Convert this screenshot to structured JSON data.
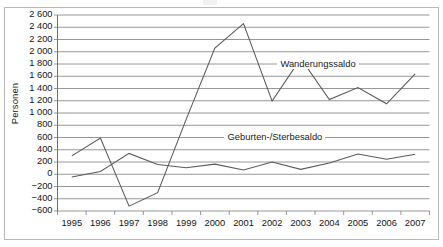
{
  "figure": {
    "y_axis_title": "Personen"
  },
  "chart_data": {
    "type": "line",
    "title": "",
    "xlabel": "",
    "ylabel": "Personen",
    "x": [
      1995,
      1996,
      1997,
      1998,
      1999,
      2000,
      2001,
      2002,
      2003,
      2004,
      2005,
      2006,
      2007
    ],
    "categories": [
      "1995",
      "1996",
      "1997",
      "1998",
      "1999",
      "2000",
      "2001",
      "2002",
      "2003",
      "2004",
      "2005",
      "2006",
      "2007"
    ],
    "ylim": [
      -600,
      2600
    ],
    "ytick_labels": [
      "2 600",
      "2 400",
      "2 200",
      "2 000",
      "1 800",
      "1 600",
      "1 400",
      "1 200",
      "1 000",
      "800",
      "600",
      "400",
      "200",
      "0",
      "−200",
      "−400",
      "−600"
    ],
    "ytick_values": [
      2600,
      2400,
      2200,
      2000,
      1800,
      1600,
      1400,
      1200,
      1000,
      800,
      600,
      400,
      200,
      0,
      -200,
      -400,
      -600
    ],
    "grid": true,
    "legend_position": "inline-annotations",
    "series": [
      {
        "name": "Wanderungssaldo",
        "values": [
          300,
          590,
          -520,
          -300,
          900,
          2060,
          2460,
          1195,
          1890,
          1220,
          1415,
          1150,
          1640
        ],
        "color": "#5a5a5a"
      },
      {
        "name": "Geburten-/Sterbesaldo",
        "values": [
          -45,
          45,
          340,
          160,
          105,
          165,
          70,
          200,
          80,
          185,
          330,
          245,
          325
        ],
        "color": "#5a5a5a"
      }
    ],
    "annotations": [
      {
        "text": "Wanderungssaldo",
        "value": 1800,
        "x_position": 2003.6
      },
      {
        "text": "Geburten-/Sterbesaldo",
        "value": 600,
        "x_position": 2002.1
      }
    ]
  }
}
